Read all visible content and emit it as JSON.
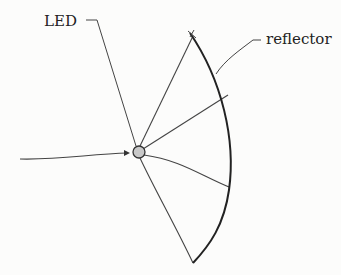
{
  "diagram": {
    "labels": {
      "led": "LED",
      "reflector": "reflector"
    },
    "colors": {
      "stroke": "#2b2b2b",
      "led_fill": "#c8c8c8",
      "background": "#fcfcfb"
    }
  }
}
